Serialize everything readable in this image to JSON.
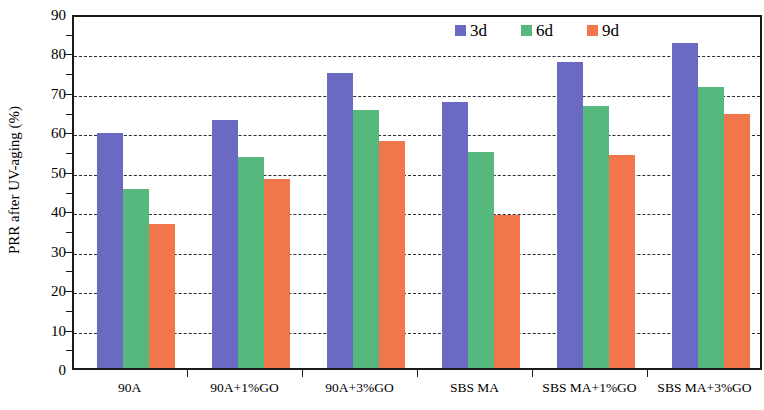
{
  "chart_data": {
    "type": "bar",
    "title": "",
    "xlabel": "",
    "ylabel": "PRR after UV-aging (%)",
    "ylim": [
      0,
      90
    ],
    "ytick_step": 10,
    "yticks": [
      0,
      10,
      20,
      30,
      40,
      50,
      60,
      70,
      80,
      90
    ],
    "ytick_labels": [
      "0",
      "10",
      "20",
      "30",
      "40",
      "50",
      "60",
      "70",
      "80",
      "90"
    ],
    "grid": true,
    "grid_axis": "y",
    "grid_style": "dashed",
    "legend_position": "top-right-inside",
    "categories": [
      "90A",
      "90A+1%GO",
      "90A+3%GO",
      "SBS MA",
      "SBS MA+1%GO",
      "SBS MA+3%GO"
    ],
    "series": [
      {
        "name": "3d",
        "color": "#6a6ac2",
        "values": [
          59.5,
          63.0,
          74.8,
          67.5,
          77.5,
          82.5
        ]
      },
      {
        "name": "6d",
        "color": "#57b87d",
        "values": [
          45.5,
          53.5,
          65.3,
          54.8,
          66.5,
          71.3
        ]
      },
      {
        "name": "9d",
        "color": "#f2764b",
        "values": [
          36.5,
          48.0,
          57.5,
          38.8,
          54.0,
          64.3
        ]
      }
    ]
  },
  "legend": {
    "items": [
      {
        "label": "3d",
        "color": "#6a6ac2"
      },
      {
        "label": "6d",
        "color": "#57b87d"
      },
      {
        "label": "9d",
        "color": "#f2764b"
      }
    ]
  },
  "axes": {
    "y_title": "PRR after UV-aging (%)"
  }
}
